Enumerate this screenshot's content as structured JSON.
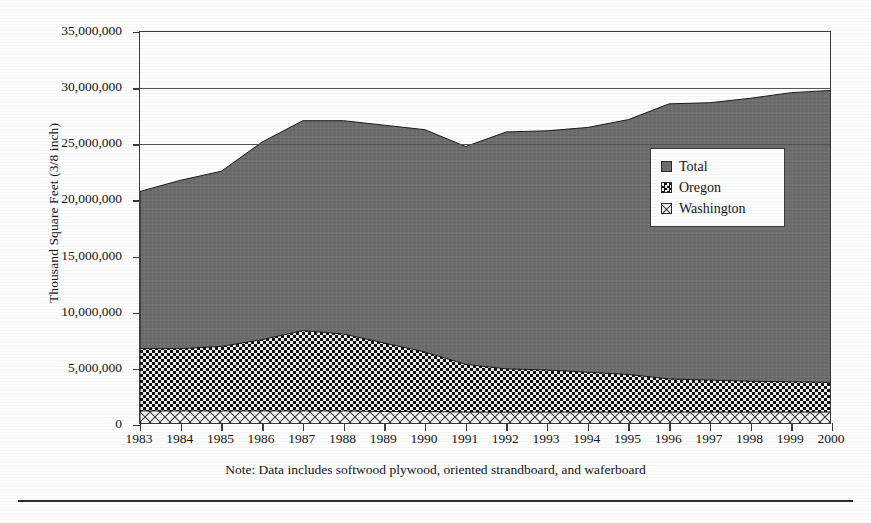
{
  "chart_data": {
    "type": "area",
    "title": "",
    "xlabel": "",
    "ylabel": "Thousand Square Feet (3/8 inch)",
    "ylim": [
      0,
      35000000
    ],
    "ytick_labels": [
      "35,000,000",
      "30,000,000",
      "25,000,000",
      "20,000,000",
      "15,000,000",
      "10,000,000",
      "5,000,000",
      "0"
    ],
    "ytick_values": [
      35000000,
      30000000,
      25000000,
      20000000,
      15000000,
      10000000,
      5000000,
      0
    ],
    "grid": true,
    "grid_axis": "y",
    "legend_position": "inside-right",
    "categories": [
      1983,
      1984,
      1985,
      1986,
      1987,
      1988,
      1989,
      1990,
      1991,
      1992,
      1993,
      1994,
      1995,
      1996,
      1997,
      1998,
      1999,
      2000
    ],
    "x": [
      "1983",
      "1984",
      "1985",
      "1986",
      "1987",
      "1988",
      "1989",
      "1990",
      "1991",
      "1992",
      "1993",
      "1994",
      "1995",
      "1996",
      "1997",
      "1998",
      "1999",
      "2000"
    ],
    "series": [
      {
        "name": "Total",
        "fill": "solid-gray",
        "color": "#6e6e6e",
        "values": [
          20800000,
          21800000,
          22600000,
          25200000,
          27100000,
          27100000,
          26700000,
          26300000,
          24800000,
          26100000,
          26200000,
          26500000,
          27200000,
          28600000,
          28700000,
          29100000,
          29600000,
          29800000
        ]
      },
      {
        "name": "Oregon",
        "fill": "checkerboard",
        "color": "#111111",
        "values": [
          6800000,
          6800000,
          7000000,
          7600000,
          8400000,
          8100000,
          7300000,
          6500000,
          5400000,
          5000000,
          4900000,
          4700000,
          4500000,
          4100000,
          4000000,
          3900000,
          3850000,
          3800000
        ]
      },
      {
        "name": "Washington",
        "fill": "diagonal-crosshatch",
        "color": "#cfcfcf",
        "values": [
          1250000,
          1250000,
          1250000,
          1250000,
          1250000,
          1250000,
          1200000,
          1200000,
          1150000,
          1150000,
          1150000,
          1150000,
          1150000,
          1150000,
          1150000,
          1150000,
          1150000,
          1150000
        ]
      }
    ],
    "note": "Note:  Data includes softwood plywood, oriented strandboard, and waferboard"
  },
  "legend": {
    "items": [
      {
        "label": "Total",
        "swatch": "solid-gray-swatch"
      },
      {
        "label": "Oregon",
        "swatch": "checkerboard-swatch"
      },
      {
        "label": "Washington",
        "swatch": "crosshatch-swatch"
      }
    ]
  }
}
